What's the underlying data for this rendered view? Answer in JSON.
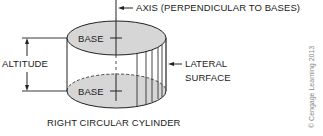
{
  "diagram": {
    "title": "RIGHT CIRCULAR CYLINDER",
    "labels": {
      "axis": "AXIS (PERPENDICULAR TO BASES)",
      "top_base": "BASE",
      "bottom_base": "BASE",
      "altitude": "ALTITUDE",
      "lateral_line1": "LATERAL",
      "lateral_line2": "SURFACE"
    },
    "copyright": "© Cengage Learning 2013",
    "colors": {
      "base_fill": "#d6d6d6",
      "stroke": "#222222",
      "background": "#ffffff"
    }
  }
}
